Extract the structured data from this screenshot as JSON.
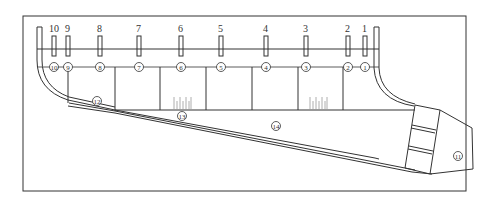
{
  "diagram": {
    "type": "engineering-schematic",
    "frame": {
      "x": 23,
      "y": 16,
      "width": 443,
      "height": 175
    },
    "probes": [
      {
        "label": "10",
        "x": 54
      },
      {
        "label": "9",
        "x": 68
      },
      {
        "label": "8",
        "x": 100
      },
      {
        "label": "7",
        "x": 139
      },
      {
        "label": "6",
        "x": 181
      },
      {
        "label": "5",
        "x": 221
      },
      {
        "label": "4",
        "x": 266
      },
      {
        "label": "3",
        "x": 306
      },
      {
        "label": "2",
        "x": 348
      },
      {
        "label": "1",
        "x": 365
      }
    ],
    "stations": [
      {
        "label": "⑩",
        "x": 54
      },
      {
        "label": "⑨",
        "x": 68
      },
      {
        "label": "⑧",
        "x": 100
      },
      {
        "label": "⑦",
        "x": 139
      },
      {
        "label": "⑥",
        "x": 181
      },
      {
        "label": "⑤",
        "x": 221
      },
      {
        "label": "④",
        "x": 266
      },
      {
        "label": "③",
        "x": 306
      },
      {
        "label": "②",
        "x": 348
      },
      {
        "label": "①",
        "x": 365
      }
    ],
    "regions": [
      {
        "label": "⑫",
        "x": 97,
        "y": 101
      },
      {
        "label": "⑬",
        "x": 182,
        "y": 116
      },
      {
        "label": "⑭",
        "x": 276,
        "y": 126
      },
      {
        "label": "⑪",
        "x": 458,
        "y": 156
      }
    ],
    "colors": {
      "line": "#333333",
      "tick": "#999999",
      "background": "#ffffff"
    }
  }
}
